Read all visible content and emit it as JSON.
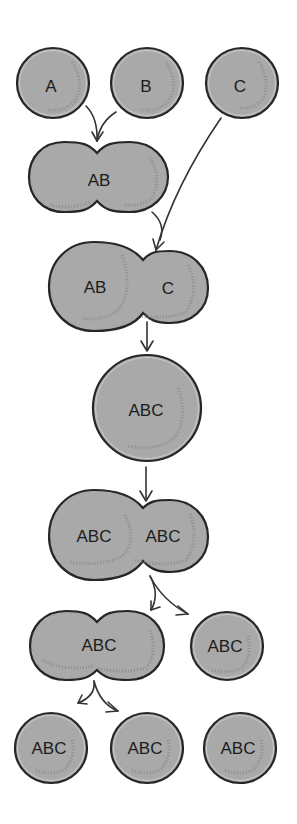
{
  "diagram": {
    "type": "cell fusion and division sequence",
    "colors": {
      "cell_fill": "#a9a9a9",
      "cell_stroke": "#262626",
      "arrow": "#333333",
      "background": "#ffffff"
    },
    "rows": [
      {
        "stage": "separate cells",
        "cells": [
          {
            "label": "A"
          },
          {
            "label": "B"
          },
          {
            "label": "C"
          }
        ]
      },
      {
        "stage": "fusion of A and B",
        "cells": [
          {
            "label": "AB"
          }
        ]
      },
      {
        "stage": "fusion of AB with C",
        "cells": [
          {
            "label_left": "AB",
            "label_right": "C"
          }
        ]
      },
      {
        "stage": "hybrid cell",
        "cells": [
          {
            "label": "ABC"
          }
        ]
      },
      {
        "stage": "dividing hybrid",
        "cells": [
          {
            "label_left": "ABC",
            "label_right": "ABC"
          }
        ]
      },
      {
        "stage": "daughter cells",
        "cells": [
          {
            "label": "ABC"
          },
          {
            "label": "ABC"
          }
        ]
      },
      {
        "stage": "final cells",
        "cells": [
          {
            "label": "ABC"
          },
          {
            "label": "ABC"
          },
          {
            "label": "ABC"
          }
        ]
      }
    ]
  }
}
